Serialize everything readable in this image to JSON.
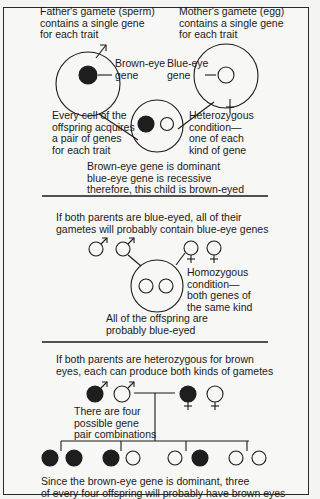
{
  "panel1": {
    "father_label": "Father's gamete (sperm)\ncontains a single gene\nfor each trait",
    "mother_label": "Mother's gamete (egg)\ncontains a single gene\nfor each trait",
    "brown_gene_label": "Brown-eye\ngene",
    "blue_gene_label": "Blue-eye\ngene",
    "offspring_label": "Every cell of the\noffspring acquires\na pair of genes\nfor each trait",
    "hetero_label": "Heterozygous\ncondition—\none of each\nkind of gene",
    "conclusion": "Brown-eye gene is dominant\nblue-eye gene is recessive\ntherefore, this child is brown-eyed"
  },
  "panel2": {
    "intro": "If both parents are blue-eyed, all of their\ngametes will probably contain blue-eye genes",
    "homo_label": "Homozygous\ncondition—\nboth genes of\nthe same kind",
    "conclusion": "All of the offspring are\nprobably blue-eyed"
  },
  "panel3": {
    "intro": "If both parents are heterozygous for brown\neyes, each can produce both kinds of gametes",
    "combos_label": "There are four\npossible gene\npair combinations",
    "conclusion": "Since the brown-eye gene is dominant, three\nof every four offspring will probably have brown eyes",
    "combinations": [
      [
        "brown",
        "brown"
      ],
      [
        "brown",
        "blue"
      ],
      [
        "blue",
        "brown"
      ],
      [
        "blue",
        "blue"
      ]
    ]
  },
  "colors": {
    "ink": "#1a1a1a",
    "dominant_gene": "#1e1e1e",
    "background": "#f7f7f5"
  }
}
